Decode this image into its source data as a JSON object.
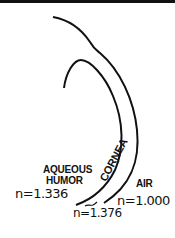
{
  "diagram": {
    "title": "",
    "structures": {
      "cornea_label": "CORNEA",
      "aqueous_line1": "AQUEOUS",
      "aqueous_line2": "HUMOR",
      "air_label": "AIR"
    },
    "refractive_indices": {
      "aqueous_humor": "n=1.336",
      "cornea": "n=1.376",
      "air": "n=1.000"
    },
    "colors": {
      "line": "#111111",
      "background": "#ffffff"
    }
  }
}
